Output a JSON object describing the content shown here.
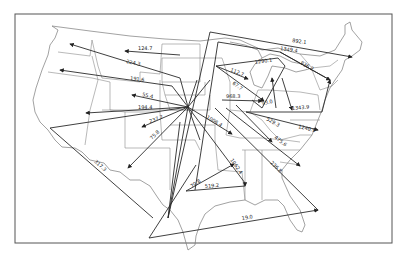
{
  "map": {
    "subject": "United States flow map",
    "flows": [
      {
        "label": "124.7"
      },
      {
        "label": "224.3"
      },
      {
        "label": "191.6"
      },
      {
        "label": "55.4"
      },
      {
        "label": "194.4"
      },
      {
        "label": "237.7"
      },
      {
        "label": "75.8"
      },
      {
        "label": "317.3"
      },
      {
        "label": "1006.4"
      },
      {
        "label": "1062.4"
      },
      {
        "label": "70.8"
      },
      {
        "label": "519.2"
      },
      {
        "label": "19.0"
      },
      {
        "label": "892.1"
      },
      {
        "label": "1349.4"
      },
      {
        "label": "836.2"
      },
      {
        "label": "112.7"
      },
      {
        "label": "67.7"
      },
      {
        "label": "1290.1"
      },
      {
        "label": "968.3"
      },
      {
        "label": "93.0"
      },
      {
        "label": "1343.9"
      },
      {
        "label": "1240.9"
      },
      {
        "label": "529.3"
      },
      {
        "label": "475.6"
      },
      {
        "label": "236.8"
      }
    ]
  }
}
